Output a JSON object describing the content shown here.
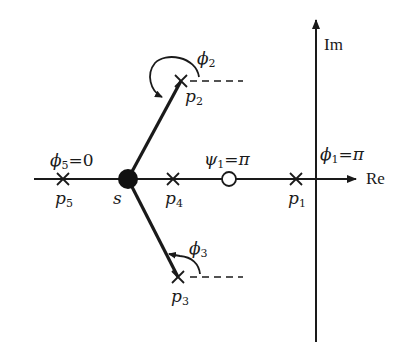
{
  "diagram": {
    "type": "root-locus angle condition (s-plane)",
    "axes": {
      "real_label": "Re",
      "imag_label": "Im"
    },
    "test_point": {
      "label": "s"
    },
    "poles": [
      {
        "id": "p1",
        "sym": "p",
        "sub": "1",
        "angle_sym": "ϕ",
        "angle_sub": "1",
        "angle_value": "=π"
      },
      {
        "id": "p2",
        "sym": "p",
        "sub": "2",
        "angle_sym": "ϕ",
        "angle_sub": "2",
        "angle_value": ""
      },
      {
        "id": "p3",
        "sym": "p",
        "sub": "3",
        "angle_sym": "ϕ",
        "angle_sub": "3",
        "angle_value": ""
      },
      {
        "id": "p4",
        "sym": "p",
        "sub": "4"
      },
      {
        "id": "p5",
        "sym": "p",
        "sub": "5",
        "angle_sym": "ϕ",
        "angle_sub": "5",
        "angle_value": "=0"
      }
    ],
    "zeros": [
      {
        "id": "z1",
        "angle_sym": "ψ",
        "angle_sub": "1",
        "angle_value": "=π"
      }
    ],
    "colors": {
      "ink": "#1a1a1a",
      "background": "#ffffff"
    }
  }
}
